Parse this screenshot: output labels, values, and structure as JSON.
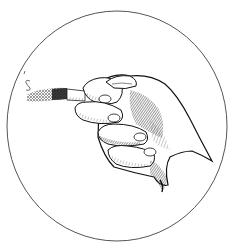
{
  "image": {
    "width": 232,
    "height": 245,
    "background": "#ffffff",
    "subject": "Engraving-style illustration of a hand holding a lit cigarette, framed by a thin circle",
    "frame": {
      "shape": "circle",
      "cx": 117,
      "cy": 126,
      "rx": 110,
      "ry": 115,
      "stroke": "#555555",
      "stroke_width": 1
    },
    "elements": [
      {
        "name": "smoke-wisp",
        "x": 24,
        "y": 72
      },
      {
        "name": "cigarette-ash",
        "x": 27,
        "y": 88,
        "width": 40,
        "height": 12
      },
      {
        "name": "cigarette-paper",
        "x": 67,
        "y": 91,
        "width": 18,
        "height": 10
      },
      {
        "name": "hand",
        "x": 70,
        "y": 74,
        "width": 140,
        "height": 120
      }
    ],
    "colors": {
      "ink": "#111111",
      "hatch": "#333333",
      "paper": "#ffffff"
    }
  }
}
